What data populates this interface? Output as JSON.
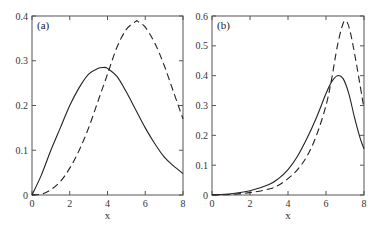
{
  "chart_data": [
    {
      "type": "line",
      "panel_label": "(a)",
      "xlabel": "x",
      "ylabel": "",
      "xlim": [
        0,
        8
      ],
      "ylim": [
        0,
        0.4
      ],
      "xticks": [
        "0",
        "2",
        "4",
        "6",
        "8"
      ],
      "yticks": [
        "0",
        "0.1",
        "0.2",
        "0.3",
        "0.4"
      ],
      "grid": false,
      "legend": null,
      "series": [
        {
          "name": "solid",
          "style": "solid",
          "x": [
            0,
            0.5,
            1,
            1.5,
            2,
            2.5,
            3,
            3.5,
            3.8,
            4,
            4.5,
            5,
            5.5,
            6,
            6.5,
            7,
            7.5,
            8
          ],
          "y": [
            0,
            0.045,
            0.1,
            0.15,
            0.2,
            0.24,
            0.27,
            0.283,
            0.285,
            0.283,
            0.265,
            0.23,
            0.19,
            0.15,
            0.115,
            0.085,
            0.065,
            0.048
          ]
        },
        {
          "name": "dashed",
          "style": "dashed",
          "x": [
            0,
            0.5,
            1,
            1.5,
            2,
            2.5,
            3,
            3.5,
            4,
            4.5,
            5,
            5.5,
            5.6,
            6,
            6.5,
            7,
            7.5,
            8
          ],
          "y": [
            0,
            0.002,
            0.012,
            0.03,
            0.06,
            0.1,
            0.15,
            0.21,
            0.27,
            0.33,
            0.37,
            0.388,
            0.388,
            0.375,
            0.34,
            0.29,
            0.23,
            0.17
          ]
        }
      ]
    },
    {
      "type": "line",
      "panel_label": "(b)",
      "xlabel": "x",
      "ylabel": "",
      "xlim": [
        0,
        8
      ],
      "ylim": [
        0,
        0.6
      ],
      "xticks": [
        "0",
        "2",
        "4",
        "6",
        "8"
      ],
      "yticks": [
        "0",
        "0.1",
        "0.2",
        "0.3",
        "0.4",
        "0.5",
        "0.6"
      ],
      "grid": false,
      "legend": null,
      "series": [
        {
          "name": "solid",
          "style": "solid",
          "x": [
            0,
            1,
            2,
            3,
            3.5,
            4,
            4.5,
            5,
            5.5,
            6,
            6.3,
            6.6,
            6.9,
            7.2,
            7.5,
            7.8,
            8
          ],
          "y": [
            0,
            0.004,
            0.014,
            0.035,
            0.055,
            0.085,
            0.13,
            0.19,
            0.26,
            0.34,
            0.38,
            0.4,
            0.39,
            0.34,
            0.26,
            0.19,
            0.155
          ]
        },
        {
          "name": "dashed",
          "style": "dashed",
          "x": [
            0,
            1,
            2,
            3,
            3.5,
            4,
            4.5,
            5,
            5.5,
            6,
            6.3,
            6.6,
            6.9,
            7.1,
            7.3,
            7.6,
            8
          ],
          "y": [
            0,
            0.002,
            0.008,
            0.02,
            0.033,
            0.055,
            0.085,
            0.13,
            0.2,
            0.3,
            0.39,
            0.5,
            0.575,
            0.58,
            0.54,
            0.44,
            0.29
          ]
        }
      ]
    }
  ]
}
